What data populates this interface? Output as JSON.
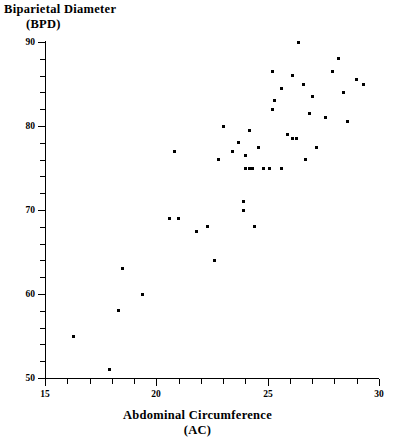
{
  "chart_data": {
    "type": "scatter",
    "title": "",
    "ylabel_line1": "Biparietal  Diameter",
    "ylabel_line2": "(BPD)",
    "xlabel_line1": "Abdominal  Circumference",
    "xlabel_line2": "(AC)",
    "xlabel": "Abdominal Circumference (AC)",
    "ylabel": "Biparietal Diameter (BPD)",
    "xlim": [
      15,
      30
    ],
    "ylim": [
      50,
      90
    ],
    "x_major_ticks": [
      15,
      20,
      25,
      30
    ],
    "y_major_ticks": [
      50,
      60,
      70,
      80,
      90
    ],
    "x_minor_step": 1,
    "y_minor_step": 2,
    "grid": false,
    "legend": null,
    "marker_color": "#000000",
    "axis_color": "#000000",
    "background_color": "#ffffff",
    "points": [
      {
        "x": 16.3,
        "y": 55.0
      },
      {
        "x": 17.9,
        "y": 51.0
      },
      {
        "x": 18.5,
        "y": 63.0
      },
      {
        "x": 18.3,
        "y": 58.0
      },
      {
        "x": 19.4,
        "y": 60.0
      },
      {
        "x": 20.6,
        "y": 69.0
      },
      {
        "x": 21.0,
        "y": 69.0
      },
      {
        "x": 20.8,
        "y": 77.0
      },
      {
        "x": 21.8,
        "y": 67.5
      },
      {
        "x": 22.3,
        "y": 68.0
      },
      {
        "x": 22.6,
        "y": 64.0
      },
      {
        "x": 22.8,
        "y": 76.0
      },
      {
        "x": 23.0,
        "y": 80.0
      },
      {
        "x": 23.4,
        "y": 77.0
      },
      {
        "x": 23.9,
        "y": 71.0
      },
      {
        "x": 23.9,
        "y": 70.0
      },
      {
        "x": 24.4,
        "y": 68.0
      },
      {
        "x": 23.7,
        "y": 78.0
      },
      {
        "x": 24.0,
        "y": 76.5
      },
      {
        "x": 24.0,
        "y": 75.0
      },
      {
        "x": 24.2,
        "y": 75.0
      },
      {
        "x": 24.3,
        "y": 75.0
      },
      {
        "x": 24.8,
        "y": 75.0
      },
      {
        "x": 25.1,
        "y": 75.0
      },
      {
        "x": 25.6,
        "y": 75.0
      },
      {
        "x": 24.2,
        "y": 79.5
      },
      {
        "x": 24.6,
        "y": 77.5
      },
      {
        "x": 25.2,
        "y": 86.5
      },
      {
        "x": 25.3,
        "y": 83.0
      },
      {
        "x": 25.6,
        "y": 84.5
      },
      {
        "x": 25.2,
        "y": 82.0
      },
      {
        "x": 25.9,
        "y": 79.0
      },
      {
        "x": 26.1,
        "y": 78.5
      },
      {
        "x": 26.3,
        "y": 78.5
      },
      {
        "x": 26.4,
        "y": 90.0
      },
      {
        "x": 26.1,
        "y": 86.0
      },
      {
        "x": 26.6,
        "y": 85.0
      },
      {
        "x": 26.7,
        "y": 76.0
      },
      {
        "x": 26.9,
        "y": 81.5
      },
      {
        "x": 27.0,
        "y": 83.5
      },
      {
        "x": 27.2,
        "y": 77.5
      },
      {
        "x": 27.6,
        "y": 81.0
      },
      {
        "x": 27.9,
        "y": 86.5
      },
      {
        "x": 28.2,
        "y": 88.0
      },
      {
        "x": 28.4,
        "y": 84.0
      },
      {
        "x": 28.6,
        "y": 80.5
      },
      {
        "x": 29.0,
        "y": 85.5
      },
      {
        "x": 29.3,
        "y": 85.0
      }
    ]
  }
}
